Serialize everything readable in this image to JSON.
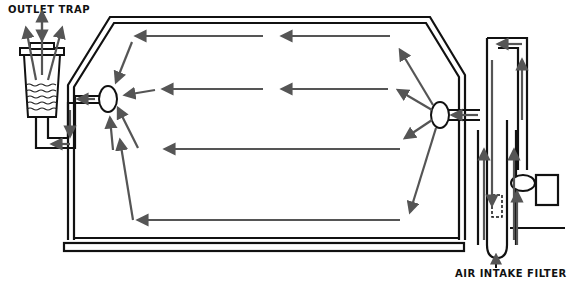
{
  "diagram": {
    "type": "air-flow schematic",
    "labels": {
      "outlet_trap": "OUTLET TRAP",
      "air_intake_filter": "AIR INTAKE FILTER"
    },
    "components": [
      "outlet-trap",
      "chamber",
      "inlet-nozzle",
      "outlet-nozzle",
      "air-intake-filter",
      "blower"
    ],
    "flow_direction": "right-to-left",
    "colors": {
      "line": "#111111",
      "arrow": "#555555",
      "background": "#ffffff"
    }
  }
}
